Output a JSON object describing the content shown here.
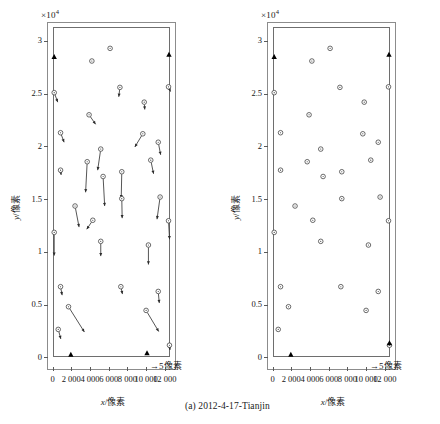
{
  "figure": {
    "caption": "(a) 2012-4-17-Tianjin",
    "exponent_label": "×10",
    "exponent_sup": "4",
    "scalebar_label": "5像素",
    "scalebar_arrow": "→"
  },
  "axes": {
    "x_title": "x/像素",
    "y_title": "y/像素",
    "x_ticks": [
      "0",
      "2 000",
      "4 000",
      "6 000",
      "8 000",
      "10 000",
      "12 000"
    ],
    "x_tick_values": [
      0,
      2000,
      4000,
      6000,
      8000,
      10000,
      12000
    ],
    "y_ticks": [
      "0",
      "0.5",
      "1",
      "1.5",
      "2",
      "2.5",
      "3"
    ],
    "y_tick_values": [
      0,
      5000,
      10000,
      15000,
      20000,
      25000,
      30000
    ],
    "xlim": [
      -600,
      13200
    ],
    "ylim": [
      -1200,
      31800
    ],
    "data_frame_xlim": [
      0,
      12600
    ],
    "data_frame_ylim": [
      0,
      31300
    ]
  },
  "colors": {
    "frame": "#6e6e6e",
    "outer_frame": "#8c8c8c",
    "marker_stroke": "#3a3a3a",
    "marker_fill": "#ffffff",
    "arrow": "#2b2b2b",
    "triangle": "#000000",
    "text": "#161616"
  },
  "chart_data": {
    "type": "scatter",
    "title": "(a) 2012-4-17-Tianjin",
    "xlabel": "x/像素",
    "ylabel": "y/像素",
    "xlim": [
      -600,
      13200
    ],
    "ylim": [
      -1200,
      31800
    ],
    "x_scale_note": "×10^4 applies to y axis tick labels",
    "grid": false,
    "legend": null,
    "panels": [
      {
        "name": "left-panel-with-displacement-vectors",
        "marker": "open-circle",
        "has_vectors": true,
        "vector_scale_label": "5像素",
        "points": [
          {
            "x": 6150,
            "y": 29300,
            "dx": 0,
            "dy": 0
          },
          {
            "x": 4200,
            "y": 28100,
            "dx": 0,
            "dy": 0
          },
          {
            "x": 7200,
            "y": 25600,
            "dx": -120,
            "dy": -900
          },
          {
            "x": 12400,
            "y": 25650,
            "dx": 220,
            "dy": -450
          },
          {
            "x": 170,
            "y": 25100,
            "dx": 380,
            "dy": -900
          },
          {
            "x": 9800,
            "y": 24200,
            "dx": 60,
            "dy": -700
          },
          {
            "x": 3900,
            "y": 23000,
            "dx": 700,
            "dy": -900
          },
          {
            "x": 850,
            "y": 21300,
            "dx": 380,
            "dy": -900
          },
          {
            "x": 9650,
            "y": 21200,
            "dx": -850,
            "dy": -1250
          },
          {
            "x": 11300,
            "y": 20400,
            "dx": 260,
            "dy": -1200
          },
          {
            "x": 5150,
            "y": 19750,
            "dx": -330,
            "dy": -2000
          },
          {
            "x": 850,
            "y": 17750,
            "dx": 60,
            "dy": -450
          },
          {
            "x": 3700,
            "y": 18550,
            "dx": -170,
            "dy": -2900
          },
          {
            "x": 10500,
            "y": 18700,
            "dx": 300,
            "dy": -1300
          },
          {
            "x": 7400,
            "y": 17600,
            "dx": -60,
            "dy": -2500
          },
          {
            "x": 5400,
            "y": 17150,
            "dx": 170,
            "dy": -2800
          },
          {
            "x": 11500,
            "y": 15200,
            "dx": -330,
            "dy": -2100
          },
          {
            "x": 7400,
            "y": 15050,
            "dx": 40,
            "dy": -1850
          },
          {
            "x": 2400,
            "y": 14350,
            "dx": 430,
            "dy": -2000
          },
          {
            "x": 4300,
            "y": 13000,
            "dx": -650,
            "dy": -850
          },
          {
            "x": 12400,
            "y": 12950,
            "dx": 110,
            "dy": -1750
          },
          {
            "x": 170,
            "y": 11850,
            "dx": 0,
            "dy": -2200
          },
          {
            "x": 5150,
            "y": 11000,
            "dx": 0,
            "dy": -1400
          },
          {
            "x": 10250,
            "y": 10650,
            "dx": 0,
            "dy": -1850
          },
          {
            "x": 850,
            "y": 6700,
            "dx": 170,
            "dy": -800
          },
          {
            "x": 7300,
            "y": 6700,
            "dx": 170,
            "dy": -700
          },
          {
            "x": 11300,
            "y": 6250,
            "dx": 110,
            "dy": -1100
          },
          {
            "x": 1700,
            "y": 4800,
            "dx": 1700,
            "dy": -2400
          },
          {
            "x": 10000,
            "y": 4450,
            "dx": 1350,
            "dy": -2000
          },
          {
            "x": 600,
            "y": 2650,
            "dx": 280,
            "dy": -900
          },
          {
            "x": 12500,
            "y": 1150,
            "dx": 60,
            "dy": -450
          }
        ],
        "triangles": [
          {
            "x": 170,
            "y": 28500
          },
          {
            "x": 12450,
            "y": 28700
          },
          {
            "x": 1950,
            "y": 250
          },
          {
            "x": 10100,
            "y": 400
          }
        ]
      },
      {
        "name": "right-panel-points-only",
        "marker": "open-circle",
        "has_vectors": false,
        "points": [
          {
            "x": 6150,
            "y": 29300
          },
          {
            "x": 4200,
            "y": 28100
          },
          {
            "x": 7200,
            "y": 25600
          },
          {
            "x": 12400,
            "y": 25650
          },
          {
            "x": 170,
            "y": 25100
          },
          {
            "x": 9800,
            "y": 24200
          },
          {
            "x": 3900,
            "y": 23000
          },
          {
            "x": 850,
            "y": 21300
          },
          {
            "x": 9650,
            "y": 21200
          },
          {
            "x": 11300,
            "y": 20400
          },
          {
            "x": 5150,
            "y": 19750
          },
          {
            "x": 850,
            "y": 17750
          },
          {
            "x": 3700,
            "y": 18550
          },
          {
            "x": 10500,
            "y": 18700
          },
          {
            "x": 7400,
            "y": 17600
          },
          {
            "x": 5400,
            "y": 17150
          },
          {
            "x": 11500,
            "y": 15200
          },
          {
            "x": 7400,
            "y": 15050
          },
          {
            "x": 2400,
            "y": 14350
          },
          {
            "x": 4300,
            "y": 13000
          },
          {
            "x": 12400,
            "y": 12950
          },
          {
            "x": 170,
            "y": 11850
          },
          {
            "x": 5150,
            "y": 11000
          },
          {
            "x": 10250,
            "y": 10650
          },
          {
            "x": 850,
            "y": 6700
          },
          {
            "x": 7300,
            "y": 6700
          },
          {
            "x": 11300,
            "y": 6250
          },
          {
            "x": 1700,
            "y": 4800
          },
          {
            "x": 10000,
            "y": 4450
          },
          {
            "x": 600,
            "y": 2650
          },
          {
            "x": 12500,
            "y": 1150
          }
        ],
        "triangles": [
          {
            "x": 170,
            "y": 28500
          },
          {
            "x": 12450,
            "y": 28700
          },
          {
            "x": 1950,
            "y": 250
          },
          {
            "x": 12500,
            "y": 1350
          }
        ]
      }
    ]
  }
}
